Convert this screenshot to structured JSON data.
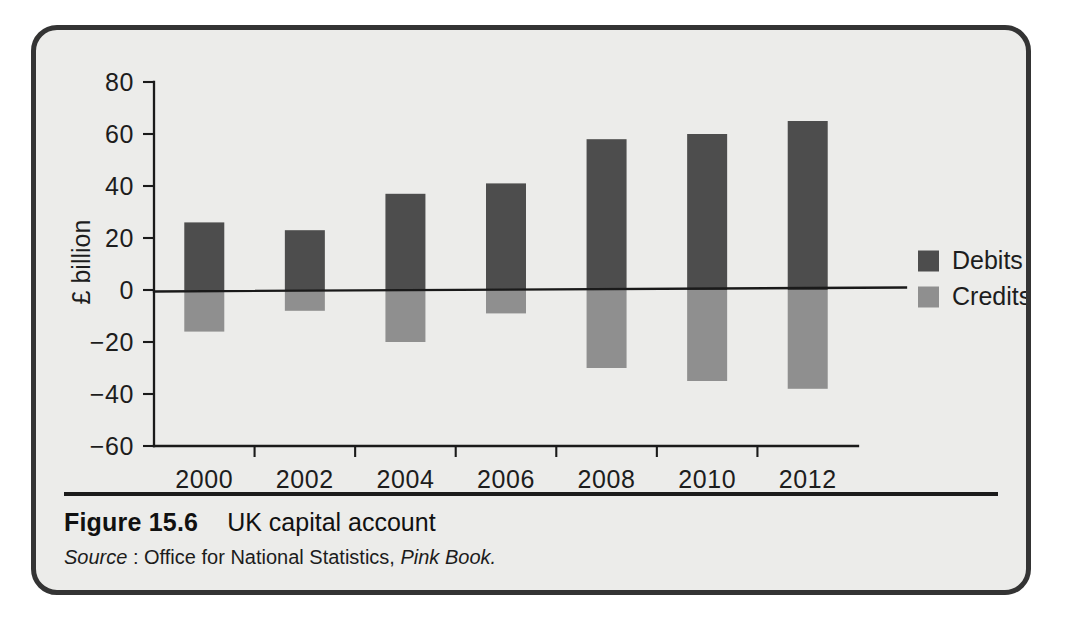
{
  "figure": {
    "caption_number": "Figure 15.6",
    "caption_title": "UK capital account",
    "source_label": "Source",
    "source_text": ": Office for National Statistics, ",
    "source_publication": "Pink Book."
  },
  "colors": {
    "debits": "#4d4d4d",
    "credits": "#8f8f8f",
    "background": "#ececea",
    "border": "#343434",
    "axis": "#1a1a1a"
  },
  "legend": {
    "position": "right",
    "entries": [
      {
        "label": "Debits",
        "color": "#4d4d4d"
      },
      {
        "label": "Credits",
        "color": "#8f8f8f"
      }
    ]
  },
  "axes": {
    "ylabel": "£ billion",
    "xlabel": "",
    "yticks": [
      "80",
      "60",
      "40",
      "20",
      "0",
      "−20",
      "−40",
      "−60"
    ],
    "ytick_values": [
      80,
      60,
      40,
      20,
      0,
      -20,
      -40,
      -60
    ],
    "ylim": [
      -60,
      80
    ],
    "xticks": [
      "2000",
      "2002",
      "2004",
      "2006",
      "2008",
      "2010",
      "2012"
    ],
    "grid": false
  },
  "chart_data": {
    "type": "bar",
    "title": "UK capital account",
    "xlabel": "",
    "ylabel": "£ billion",
    "ylim": [
      -60,
      80
    ],
    "grid": false,
    "legend_position": "right",
    "categories": [
      "2000",
      "2002",
      "2004",
      "2006",
      "2008",
      "2010",
      "2012"
    ],
    "series": [
      {
        "name": "Debits",
        "color": "#4d4d4d",
        "values": [
          26,
          23,
          37,
          41,
          58,
          60,
          65
        ]
      },
      {
        "name": "Credits",
        "color": "#8f8f8f",
        "values": [
          -16,
          -8,
          -20,
          -9,
          -30,
          -35,
          -38
        ]
      }
    ]
  }
}
